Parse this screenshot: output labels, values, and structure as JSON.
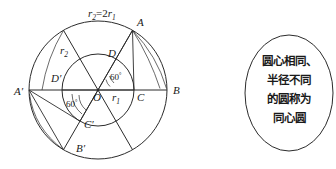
{
  "figure": {
    "title_label": "r",
    "radius_relation": {
      "base": "r",
      "sub1": "2",
      "equals": "=2",
      "base2": "r",
      "sub2": "1",
      "full": "r₂=2r₁"
    },
    "labels": {
      "A": "A",
      "B": "B",
      "C": "C",
      "D": "D",
      "A_prime": "A′",
      "B_prime": "B′",
      "C_prime": "C′",
      "D_prime": "D′",
      "O": "O",
      "r1_base": "r",
      "r1_sub": "1",
      "r2_base": "r",
      "r2_sub": "2",
      "angle_upper": "60",
      "angle_upper_deg": "°",
      "angle_lower": "60",
      "angle_lower_deg": "°"
    },
    "geometry": {
      "center_x": 98,
      "center_y": 90,
      "outer_radius": 69,
      "inner_radius": 36
    },
    "colors": {
      "stroke": "#2b2b2b",
      "text": "#1a1a1a",
      "background": "#ffffff"
    }
  },
  "callout": {
    "lines": [
      "圆心相同、",
      "半径不同",
      "的圆称为",
      "同心圆"
    ],
    "line1": "圆心相同、",
    "line2": "半径不同",
    "line3": "的圆称为",
    "line4": "同心圆"
  }
}
